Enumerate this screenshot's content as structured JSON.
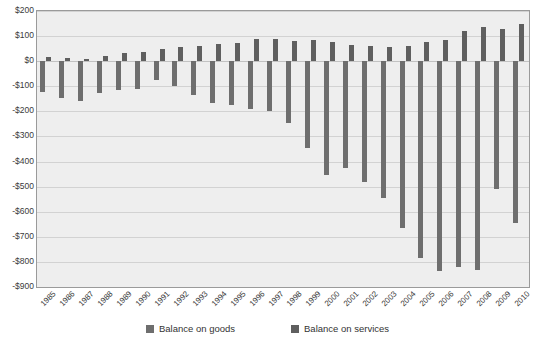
{
  "chart_data": {
    "type": "bar",
    "title": "",
    "subtitle": "",
    "xlabel": "",
    "ylabel": "",
    "grid": true,
    "legend_position": "bottom",
    "ylim": [
      -900,
      200
    ],
    "ytick_step": 100,
    "ytick_labels": [
      "$200",
      "$100",
      "$0",
      "-$100",
      "-$200",
      "-$300",
      "-$400",
      "-$500",
      "-$600",
      "-$700",
      "-$800",
      "-$900"
    ],
    "ytick_values": [
      200,
      100,
      0,
      -100,
      -200,
      -300,
      -400,
      -500,
      -600,
      -700,
      -800,
      -900
    ],
    "categories": [
      "1985",
      "1986",
      "1987",
      "1988",
      "1989",
      "1990",
      "1991",
      "1992",
      "1993",
      "1994",
      "1995",
      "1996",
      "1997",
      "1998",
      "1999",
      "2000",
      "2001",
      "2002",
      "2003",
      "2004",
      "2005",
      "2006",
      "2007",
      "2008",
      "2009",
      "2010"
    ],
    "series": [
      {
        "name": "Balance on goods",
        "color": "#6e6e6e",
        "values": [
          -122,
          -145,
          -160,
          -127,
          -116,
          -111,
          -77,
          -97,
          -133,
          -166,
          -174,
          -191,
          -198,
          -248,
          -346,
          -452,
          -427,
          -482,
          -547,
          -665,
          -783,
          -837,
          -821,
          -834,
          -509,
          -646
        ]
      },
      {
        "name": "Balance on services",
        "color": "#5f5f5f",
        "values": [
          18,
          13,
          10,
          20,
          32,
          38,
          48,
          58,
          62,
          67,
          74,
          87,
          90,
          82,
          83,
          77,
          65,
          62,
          55,
          62,
          76,
          86,
          120,
          136,
          129,
          150
        ]
      }
    ],
    "legend": [
      "Balance on goods",
      "Balance on services"
    ]
  }
}
